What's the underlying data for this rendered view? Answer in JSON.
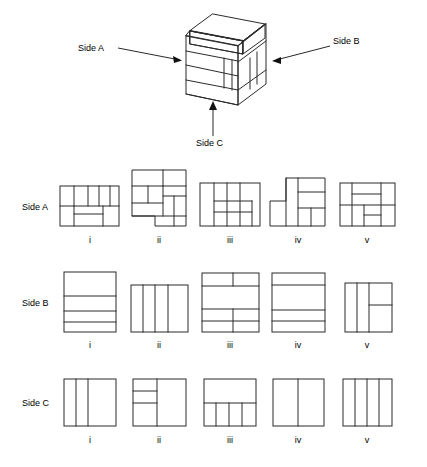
{
  "figure": {
    "background_color": "#ffffff",
    "line_color": "#2b2b2b",
    "text_color": "#000000"
  },
  "callouts": [
    {
      "id": "side-a",
      "label": "Side A",
      "arrow": "points-right-to-block-left-face"
    },
    {
      "id": "side-b",
      "label": "Side B",
      "arrow": "points-left-to-block-right-face"
    },
    {
      "id": "side-c",
      "label": "Side C",
      "arrow": "points-up-to-block-front-bottom"
    }
  ],
  "row_labels": [
    {
      "id": "row-side-a",
      "label": "Side A"
    },
    {
      "id": "row-side-b",
      "label": "Side B"
    },
    {
      "id": "row-side-c",
      "label": "Side C"
    }
  ],
  "option_labels": [
    "i",
    "ii",
    "iii",
    "iv",
    "v"
  ],
  "rows": [
    {
      "id": "side-a",
      "label": "Side A",
      "options": [
        {
          "label": "i",
          "description": "wide rectangle, top band split into four vertical cells, bottom band with small inner rectangle left of centre"
        },
        {
          "label": "ii",
          "description": "stepped outline: tall left column and lower-right block, interior split into mixed rectangles"
        },
        {
          "label": "iii",
          "description": "wide rectangle, left column full height, centre three vertical cells, inner horizontal band low centre"
        },
        {
          "label": "iv",
          "description": "stepped outline rising to the right, narrow left column, two stacked cells upper right"
        },
        {
          "label": "v",
          "description": "square, top-left large cell, right column split, lower area split into three cells"
        }
      ]
    },
    {
      "id": "side-b",
      "label": "Side B",
      "options": [
        {
          "label": "i",
          "description": "tall rectangle divided into four horizontal bands of decreasing height"
        },
        {
          "label": "ii",
          "description": "rectangle divided into four vertical strips, rightmost widest"
        },
        {
          "label": "iii",
          "description": "rectangle, thin top band split in two, wide middle band, lower bands split left/right"
        },
        {
          "label": "iv",
          "description": "rectangle with four horizontal bands, large band in the middle"
        },
        {
          "label": "v",
          "description": "rectangle split into three vertical strips, right strip cut by a short horizontal line"
        }
      ]
    },
    {
      "id": "side-c",
      "label": "Side C",
      "options": [
        {
          "label": "i",
          "description": "rectangle split into three vertical cells, middle narrow"
        },
        {
          "label": "ii",
          "description": "rectangle, left half split into three horizontal bands, right half single cell"
        },
        {
          "label": "iii",
          "description": "rectangle, large top band, bottom band split into four vertical cells"
        },
        {
          "label": "iv",
          "description": "rectangle split into two equal vertical halves"
        },
        {
          "label": "v",
          "description": "rectangle split into four vertical strips"
        }
      ]
    }
  ],
  "block": {
    "id": "isometric-block",
    "description": "Isometric drawing of a stacked rectangular solid: a lower slab of three courses, a stepped upper tier set back at the rear-left, with the right face divided into vertical panels"
  }
}
